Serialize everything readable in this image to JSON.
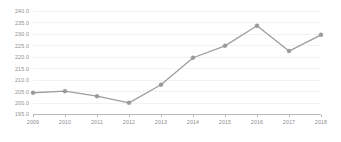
{
  "chart_data": {
    "type": "line",
    "title": "",
    "subtitle": "",
    "xlabel": "",
    "ylabel": "",
    "categories": [
      "2009",
      "2010",
      "2011",
      "2012",
      "2013",
      "2014",
      "2015",
      "2016",
      "2017",
      "2018"
    ],
    "x": [
      2009,
      2010,
      2011,
      2012,
      2013,
      2014,
      2015,
      2016,
      2017,
      2018
    ],
    "values": [
      204.5,
      205.2,
      203.0,
      200.1,
      208.0,
      219.8,
      225.0,
      233.8,
      222.7,
      229.8
    ],
    "series": [
      {
        "name": "series-1",
        "values": [
          204.5,
          205.2,
          203.0,
          200.1,
          208.0,
          219.8,
          225.0,
          233.8,
          222.7,
          229.8
        ],
        "color": "#9e9e9e",
        "marker": "circle"
      }
    ],
    "ylim": [
      195.0,
      240.0
    ],
    "ytick_values": [
      195.0,
      200.0,
      205.0,
      210.0,
      215.0,
      220.0,
      225.0,
      230.0,
      235.0,
      240.0
    ],
    "ytick_labels": [
      "195.0",
      "200.0",
      "205.0",
      "210.0",
      "215.0",
      "220.0",
      "225.0",
      "230.0",
      "235.0",
      "240.0"
    ],
    "xtick_labels": [
      "2009",
      "2010",
      "2011",
      "2012",
      "2013",
      "2014",
      "2015",
      "2016",
      "2017",
      "2018"
    ],
    "grid": true,
    "grid_axis": "y",
    "legend": false,
    "legend_position": "none",
    "annotations": [],
    "colors": {
      "line": "#9e9e9e",
      "marker": "#9a9a9a",
      "gridline": "#ececec",
      "axis": "#a6a6a6",
      "tick_text": "#8d8d8d",
      "background": "#ffffff"
    }
  }
}
